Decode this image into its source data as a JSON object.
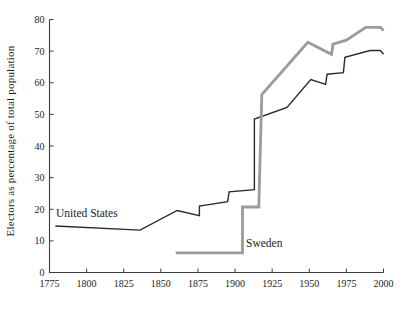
{
  "figure": {
    "background": "#ffffff",
    "axis_color": "#3d3d3d"
  },
  "chart_data": {
    "type": "line",
    "title": "",
    "xlabel": "",
    "ylabel": "Electors as percentage of total population",
    "xlim": [
      1775,
      2000
    ],
    "ylim": [
      0,
      80
    ],
    "x_ticks": [
      1775,
      1800,
      1825,
      1850,
      1875,
      1900,
      1925,
      1950,
      1975,
      2000
    ],
    "y_ticks": [
      0,
      10,
      20,
      30,
      40,
      50,
      60,
      70,
      80
    ],
    "grid": false,
    "legend": "inline-labels",
    "series": [
      {
        "name": "United States",
        "color": "#2a2a2a",
        "width": 1.4,
        "points": [
          [
            1779,
            14.7
          ],
          [
            1836,
            13.4
          ],
          [
            1861,
            19.6
          ],
          [
            1876,
            18.0
          ],
          [
            1876,
            21.0
          ],
          [
            1895,
            22.4
          ],
          [
            1896,
            25.5
          ],
          [
            1913,
            26.2
          ],
          [
            1913,
            48.5
          ],
          [
            1935,
            52.2
          ],
          [
            1951,
            61.0
          ],
          [
            1961,
            59.5
          ],
          [
            1962,
            62.7
          ],
          [
            1973,
            63.2
          ],
          [
            1974,
            68.0
          ],
          [
            1991,
            70.2
          ],
          [
            1998,
            70.2
          ],
          [
            2000,
            69.0
          ]
        ]
      },
      {
        "name": "Sweden",
        "color": "#9b9b9b",
        "width": 2.8,
        "points": [
          [
            1860,
            6.2
          ],
          [
            1905,
            6.2
          ],
          [
            1905,
            20.7
          ],
          [
            1916,
            20.7
          ],
          [
            1918,
            56.3
          ],
          [
            1949,
            72.8
          ],
          [
            1965,
            69.0
          ],
          [
            1966,
            72.2
          ],
          [
            1975,
            73.5
          ],
          [
            1988,
            77.5
          ],
          [
            1998,
            77.5
          ],
          [
            2000,
            76.5
          ]
        ]
      }
    ],
    "annotations": [
      {
        "text": "United States",
        "anchor_px": [
          56,
          217
        ]
      },
      {
        "text": "Sweden",
        "anchor_px": [
          246,
          247
        ]
      }
    ]
  }
}
